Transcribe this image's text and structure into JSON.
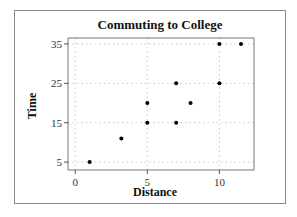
{
  "chart_data": {
    "type": "scatter",
    "title": "Commuting to College",
    "xlabel": "Distance",
    "ylabel": "Time",
    "xlim": [
      -0.5,
      12.4
    ],
    "ylim": [
      3,
      36.5
    ],
    "xticks": [
      0,
      5,
      10
    ],
    "yticks": [
      5,
      15,
      25,
      35
    ],
    "grid": true,
    "points": [
      {
        "x": 1,
        "y": 5
      },
      {
        "x": 3.2,
        "y": 11
      },
      {
        "x": 5,
        "y": 15
      },
      {
        "x": 5,
        "y": 20
      },
      {
        "x": 7,
        "y": 15
      },
      {
        "x": 7,
        "y": 25
      },
      {
        "x": 8,
        "y": 20
      },
      {
        "x": 10,
        "y": 25
      },
      {
        "x": 10,
        "y": 35
      },
      {
        "x": 11.5,
        "y": 35
      }
    ]
  }
}
